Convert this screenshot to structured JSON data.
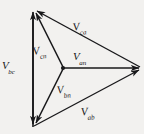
{
  "figure": {
    "type": "phasor-diagram",
    "background_color": "#f2f1ef",
    "line_color": "#18181a",
    "width": 144,
    "height": 134
  },
  "geometry": {
    "vertex_top": {
      "x": 33,
      "y": 9
    },
    "vertex_bottom": {
      "x": 33,
      "y": 127
    },
    "vertex_right": {
      "x": 141,
      "y": 68
    },
    "neutral_point": {
      "x": 63,
      "y": 68
    }
  },
  "phasors": [
    {
      "id": "vbc",
      "symbol": "V",
      "subscript": "bc",
      "label": "V_bc",
      "from": "vertex_top",
      "to": "vertex_bottom",
      "double_headed": true,
      "kind": "line-to-line"
    },
    {
      "id": "vca",
      "symbol": "V",
      "subscript": "ca",
      "label": "V_ca",
      "from": "vertex_right",
      "to": "vertex_top",
      "double_headed": false,
      "kind": "line-to-line"
    },
    {
      "id": "vab",
      "symbol": "V",
      "subscript": "ab",
      "label": "V_ab",
      "from": "vertex_bottom",
      "to": "vertex_right",
      "double_headed": false,
      "kind": "line-to-line"
    },
    {
      "id": "van",
      "symbol": "V",
      "subscript": "an",
      "label": "V_an",
      "from": "neutral_point",
      "to": "vertex_right",
      "double_headed": false,
      "kind": "phase"
    },
    {
      "id": "vbn",
      "symbol": "V",
      "subscript": "bn",
      "label": "V_bn",
      "from": "neutral_point",
      "to": "vertex_bottom",
      "double_headed": false,
      "kind": "phase"
    },
    {
      "id": "vcn",
      "symbol": "V",
      "subscript": "cn",
      "label": "V_cn",
      "from": "neutral_point",
      "to": "vertex_top",
      "double_headed": false,
      "kind": "phase"
    }
  ],
  "labels": {
    "vca": {
      "symbol": "V",
      "subscript": "ca"
    },
    "vbc": {
      "symbol": "V",
      "subscript": "bc"
    },
    "vcn": {
      "symbol": "V",
      "subscript": "cn"
    },
    "van": {
      "symbol": "V",
      "subscript": "an"
    },
    "vbn": {
      "symbol": "V",
      "subscript": "bn"
    },
    "vab": {
      "symbol": "V",
      "subscript": "ab"
    }
  }
}
